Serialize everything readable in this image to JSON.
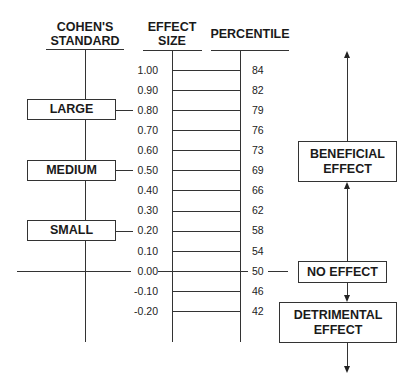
{
  "headers": {
    "cohens_standard": [
      "COHEN'S",
      "STANDARD"
    ],
    "effect_size": [
      "EFFECT",
      "SIZE"
    ],
    "percentile": "PERCENTILE"
  },
  "scale": [
    {
      "effect_size": "1.00",
      "percentile": "84"
    },
    {
      "effect_size": "0.90",
      "percentile": "82"
    },
    {
      "effect_size": "0.80",
      "percentile": "79"
    },
    {
      "effect_size": "0.70",
      "percentile": "76"
    },
    {
      "effect_size": "0.60",
      "percentile": "73"
    },
    {
      "effect_size": "0.50",
      "percentile": "69"
    },
    {
      "effect_size": "0.40",
      "percentile": "66"
    },
    {
      "effect_size": "0.30",
      "percentile": "62"
    },
    {
      "effect_size": "0.20",
      "percentile": "58"
    },
    {
      "effect_size": "0.10",
      "percentile": "54"
    },
    {
      "effect_size": "0.00",
      "percentile": "50"
    },
    {
      "effect_size": "-0.10",
      "percentile": "46"
    },
    {
      "effect_size": "-0.20",
      "percentile": "42"
    }
  ],
  "cohen_levels": {
    "large": {
      "label": "LARGE",
      "effect_size": "0.80"
    },
    "medium": {
      "label": "MEDIUM",
      "effect_size": "0.50"
    },
    "small": {
      "label": "SMALL",
      "effect_size": "0.20"
    }
  },
  "effect_direction": {
    "beneficial": [
      "BENEFICIAL",
      "EFFECT"
    ],
    "no_effect": "NO EFFECT",
    "detrimental": [
      "DETRIMENTAL",
      "EFFECT"
    ]
  },
  "colors": {
    "line": "#333333",
    "text": "#1a1a1a",
    "background": "#ffffff"
  }
}
